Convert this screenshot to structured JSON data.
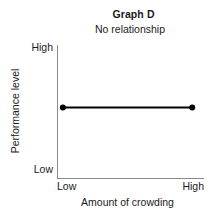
{
  "chart_data": {
    "type": "line",
    "title": "Graph D",
    "subtitle": "No relationship",
    "xlabel": "Amount of crowding",
    "ylabel": "Performance level",
    "x_tick_labels": [
      "Low",
      "High"
    ],
    "y_tick_labels": [
      "Low",
      "High"
    ],
    "xlim": [
      0,
      1
    ],
    "ylim": [
      0,
      1
    ],
    "grid": false,
    "legend": false,
    "series": [
      {
        "name": "No relationship",
        "x": [
          0.04,
          0.92
        ],
        "y": [
          0.53,
          0.53
        ],
        "marker": "filled-circle",
        "color": "#000000",
        "line_width": 2
      }
    ],
    "annotation": "Flat horizontal line: performance level stays constant as amount of crowding increases."
  },
  "colors": {
    "axis": "#8a8a8a",
    "data_line": "#000000",
    "text": "#1a1a1a",
    "background": "#ffffff"
  }
}
